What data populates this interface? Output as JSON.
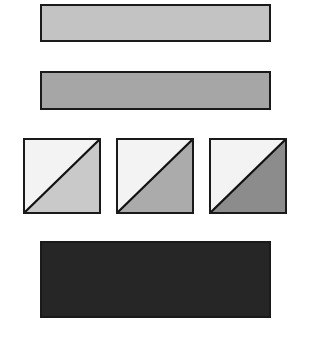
{
  "shapes": {
    "bar_light": {
      "color": "#c3c3c3"
    },
    "bar_medium": {
      "color": "#a6a6a6"
    },
    "squares": [
      {
        "upper_color": "#f3f3f3",
        "lower_color": "#c9c9c9"
      },
      {
        "upper_color": "#f3f3f3",
        "lower_color": "#ababab"
      },
      {
        "upper_color": "#f3f3f3",
        "lower_color": "#8c8c8c"
      }
    ],
    "bar_dark": {
      "color": "#262626"
    },
    "border_color": "#1a1a1a"
  }
}
